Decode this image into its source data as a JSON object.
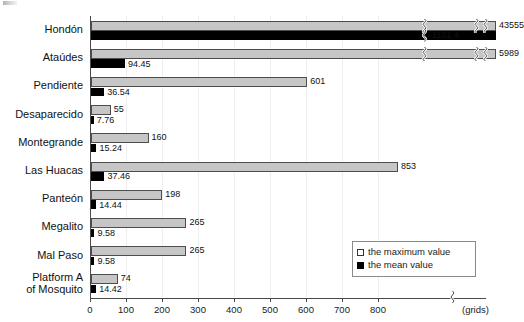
{
  "chart_data": {
    "type": "bar",
    "orientation": "horizontal",
    "title": "",
    "subtitle": "",
    "xlabel": "(grids)",
    "ylabel": "",
    "categories": [
      "Hondón",
      "Ataúdes",
      "Pendiente",
      "Desaparecido",
      "Montegrande",
      "Las Huacas",
      "Panteón",
      "Megalito",
      "Mal Paso",
      "Platform A\nof Mosquito"
    ],
    "series": [
      {
        "name": "the maximum value",
        "color": "#c6c6c6",
        "values": [
          43555,
          5989,
          601,
          55,
          160,
          853,
          198,
          265,
          265,
          74
        ],
        "labels": [
          "43555",
          "5989",
          "601",
          "55",
          "160",
          "853",
          "198",
          "265",
          "265",
          "74"
        ],
        "broken": [
          true,
          true,
          false,
          false,
          false,
          false,
          false,
          false,
          false,
          false
        ]
      },
      {
        "name": "the mean value",
        "color": "#000000",
        "values": [
          1101.4,
          94.45,
          36.54,
          7.76,
          15.24,
          37.46,
          14.44,
          9.58,
          9.58,
          14.42
        ],
        "labels": [
          "1101.4",
          "94.45",
          "36.54",
          "7.76",
          "15.24",
          "37.46",
          "14.44",
          "9.58",
          "9.58",
          "14.42"
        ],
        "broken": [
          true,
          false,
          false,
          false,
          false,
          false,
          false,
          false,
          false,
          false
        ]
      }
    ],
    "xticks": [
      0,
      100,
      200,
      300,
      400,
      500,
      600,
      700,
      800
    ],
    "xtick_labels": [
      "0",
      "100",
      "200",
      "300",
      "400",
      "500",
      "600",
      "700",
      "800"
    ],
    "xlim": [
      0,
      900
    ],
    "axis_break": true,
    "axis_break_note": "(grids)",
    "grid": true,
    "legend_position": "bottom-right",
    "legend": [
      "the maximum value",
      "the mean value"
    ]
  },
  "legend": {
    "max_label": "the maximum value",
    "mean_label": "the mean value"
  },
  "axis": {
    "units_label": "(grids)"
  }
}
